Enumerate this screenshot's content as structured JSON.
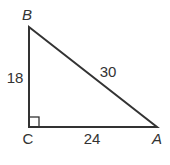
{
  "diagram": {
    "type": "right-triangle",
    "vertices": {
      "A": {
        "label": "A"
      },
      "B": {
        "label": "B"
      },
      "C": {
        "label": "C"
      }
    },
    "sides": {
      "BC": {
        "length_label": "18"
      },
      "BA": {
        "length_label": "30"
      },
      "CA": {
        "length_label": "24"
      }
    },
    "right_angle_at": "C",
    "stroke_color": "#333333"
  }
}
